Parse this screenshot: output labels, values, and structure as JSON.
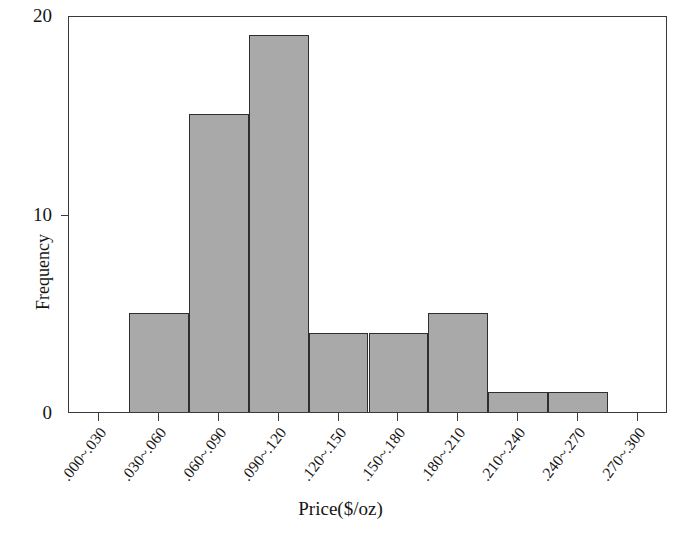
{
  "chart_data": {
    "type": "bar",
    "title": "",
    "subtitle": "",
    "xlabel": "Price($/oz)",
    "ylabel": "Frequency",
    "categories": [
      ".000~.030",
      ".030~.060",
      ".060~.090",
      ".090~.120",
      ".120~.150",
      ".150~.180",
      ".180~.210",
      ".210~.240",
      ".240~.270",
      ".270~.300"
    ],
    "values": [
      0,
      5,
      15,
      19,
      4,
      4,
      5,
      1,
      1,
      0
    ],
    "ylim": [
      0,
      20
    ],
    "yticks": [
      0,
      10,
      20
    ],
    "ytick_labels": [
      "0",
      "10",
      "20"
    ],
    "grid": false,
    "legend": null,
    "bar_fill_color": "#a9a9a9",
    "bar_edge_color": "#2e2e2e",
    "frame_color": "#3a3a3a",
    "text_color": "#151515",
    "background_color": "#ffffff",
    "x_tick_label_rotation": -52
  }
}
